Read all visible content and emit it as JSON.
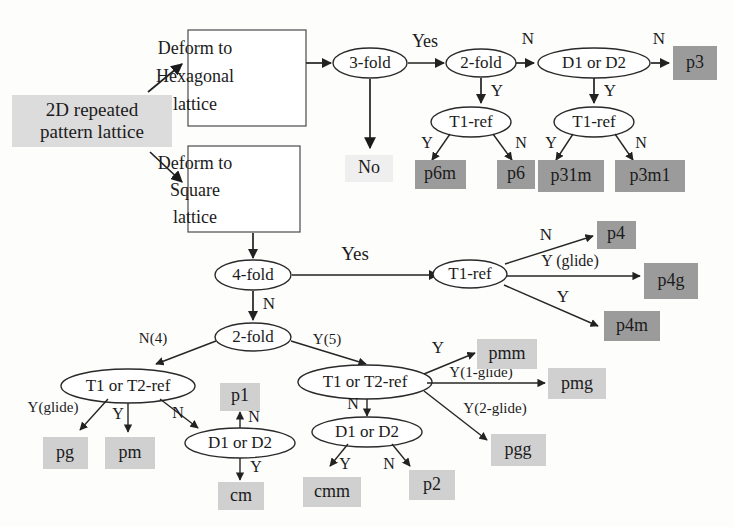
{
  "diagram": {
    "colors": {
      "terminal_dark": "#9b9b9b",
      "terminal_light": "#d0d0d0",
      "start_fill": "#dcdcdc",
      "no_fill": "#efefef",
      "no_text": "#c9c9c9",
      "stroke": "#222222",
      "page_bg": "#fdfdfc"
    },
    "start": {
      "id": "start",
      "label_line1": "2D repeated",
      "label_line2": "pattern lattice"
    },
    "process_boxes": [
      {
        "id": "deform-hexagonal",
        "lines": [
          "Deform to",
          "Hexagonal",
          "lattice"
        ]
      },
      {
        "id": "deform-square",
        "lines": [
          "Deform to",
          "Square",
          "lattice"
        ]
      }
    ],
    "decisions": [
      {
        "id": "d-3fold",
        "label": "3-fold"
      },
      {
        "id": "d-2fold-hex",
        "label": "2-fold"
      },
      {
        "id": "d-d1d2-hex",
        "label": "D1 or D2"
      },
      {
        "id": "d-t1ref-hex-a",
        "label": "T1-ref"
      },
      {
        "id": "d-t1ref-hex-b",
        "label": "T1-ref"
      },
      {
        "id": "d-4fold",
        "label": "4-fold"
      },
      {
        "id": "d-t1ref-sq",
        "label": "T1-ref"
      },
      {
        "id": "d-2fold-sq",
        "label": "2-fold"
      },
      {
        "id": "d-t1t2ref-l",
        "label": "T1 or T2-ref"
      },
      {
        "id": "d-d1d2-l",
        "label": "D1 or D2"
      },
      {
        "id": "d-t1t2ref-r",
        "label": "T1 or T2-ref"
      },
      {
        "id": "d-d1d2-r",
        "label": "D1 or D2"
      }
    ],
    "terminals": [
      {
        "id": "t-no",
        "label": "No",
        "tone": "no"
      },
      {
        "id": "t-p3",
        "label": "p3",
        "tone": "dark"
      },
      {
        "id": "t-p6m",
        "label": "p6m",
        "tone": "dark"
      },
      {
        "id": "t-p6",
        "label": "p6",
        "tone": "dark"
      },
      {
        "id": "t-p31m",
        "label": "p31m",
        "tone": "dark"
      },
      {
        "id": "t-p3m1",
        "label": "p3m1",
        "tone": "dark"
      },
      {
        "id": "t-p4",
        "label": "p4",
        "tone": "dark"
      },
      {
        "id": "t-p4g",
        "label": "p4g",
        "tone": "dark"
      },
      {
        "id": "t-p4m",
        "label": "p4m",
        "tone": "dark"
      },
      {
        "id": "t-pmm",
        "label": "pmm",
        "tone": "light"
      },
      {
        "id": "t-pmg",
        "label": "pmg",
        "tone": "light"
      },
      {
        "id": "t-pgg",
        "label": "pgg",
        "tone": "light"
      },
      {
        "id": "t-p1",
        "label": "p1",
        "tone": "light"
      },
      {
        "id": "t-pg",
        "label": "pg",
        "tone": "light"
      },
      {
        "id": "t-pm",
        "label": "pm",
        "tone": "light"
      },
      {
        "id": "t-cm",
        "label": "cm",
        "tone": "light"
      },
      {
        "id": "t-cmm",
        "label": "cmm",
        "tone": "light"
      },
      {
        "id": "t-p2",
        "label": "p2",
        "tone": "light"
      }
    ],
    "edge_labels": [
      {
        "id": "e-yes-hex",
        "label": "Yes"
      },
      {
        "id": "e-n-2fold-hex",
        "label": "N"
      },
      {
        "id": "e-y-2fold-hex",
        "label": "Y"
      },
      {
        "id": "e-n-d1d2-hex",
        "label": "N"
      },
      {
        "id": "e-y-d1d2-hex",
        "label": "Y"
      },
      {
        "id": "e-y-t1ref-a",
        "label": "Y"
      },
      {
        "id": "e-n-t1ref-a",
        "label": "N"
      },
      {
        "id": "e-y-t1ref-b",
        "label": "Y"
      },
      {
        "id": "e-n-t1ref-b",
        "label": "N"
      },
      {
        "id": "e-yes-sq",
        "label": "Yes"
      },
      {
        "id": "e-n-4fold",
        "label": "N"
      },
      {
        "id": "e-n-t1ref-sq",
        "label": "N"
      },
      {
        "id": "e-yglide-sq",
        "label": "Y (glide)"
      },
      {
        "id": "e-y-t1ref-sq",
        "label": "Y"
      },
      {
        "id": "e-n4-2fold",
        "label": "N(4)"
      },
      {
        "id": "e-y5-2fold",
        "label": "Y(5)"
      },
      {
        "id": "e-yglide-l",
        "label": "Y(glide)"
      },
      {
        "id": "e-y-t1t2-l",
        "label": "Y"
      },
      {
        "id": "e-n-t1t2-l",
        "label": "N"
      },
      {
        "id": "e-n-d1d2-l",
        "label": "N"
      },
      {
        "id": "e-y-d1d2-l",
        "label": "Y"
      },
      {
        "id": "e-y-t1t2-r",
        "label": "Y"
      },
      {
        "id": "e-y1glide-r",
        "label": "Y(1-glide)"
      },
      {
        "id": "e-y2glide-r",
        "label": "Y(2-glide)"
      },
      {
        "id": "e-n-t1t2-r",
        "label": "N"
      },
      {
        "id": "e-y-d1d2-r",
        "label": "Y"
      },
      {
        "id": "e-n-d1d2-r",
        "label": "N"
      }
    ]
  }
}
